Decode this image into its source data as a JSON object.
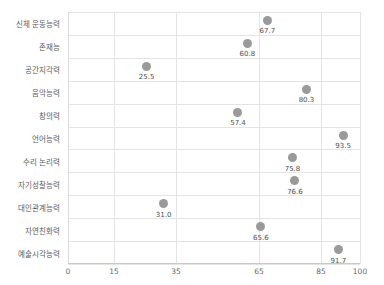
{
  "chart_data": {
    "type": "scatter",
    "title": "",
    "xlabel": "",
    "ylabel": "",
    "orientation": "horizontal",
    "grid": true,
    "legend": "none",
    "marker_color": "#9a9a9a",
    "xlim": [
      0,
      100
    ],
    "xticks": [
      0,
      15,
      35,
      65,
      85,
      100
    ],
    "xtick_labels": [
      "0",
      "15",
      "35",
      "65",
      "85",
      "100"
    ],
    "categories": [
      "신체 운동능력",
      "존재능",
      "공간지각력",
      "음악능력",
      "창의력",
      "언어능력",
      "수리 논리력",
      "자기성찰능력",
      "대인관계능력",
      "자연친화력",
      "예술시각능력"
    ],
    "values": [
      67.7,
      60.8,
      25.5,
      80.3,
      57.4,
      93.5,
      75.8,
      76.6,
      31.0,
      65.6,
      91.7
    ],
    "value_labels": [
      "67.7",
      "60.8",
      "25.5",
      "80.3",
      "57.4",
      "93.5",
      "75.8",
      "76.6",
      "31.0",
      "65.6",
      "91.7"
    ]
  },
  "axis_tick_pixels": [
    68,
    114,
    176,
    259,
    321,
    360
  ]
}
